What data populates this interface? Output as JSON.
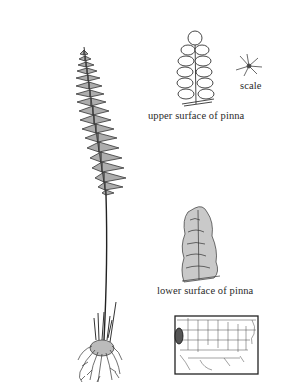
{
  "figure": {
    "labels": {
      "upper_pinna": "upper surface of pinna",
      "scale": "scale",
      "lower_pinna": "lower surface of pinna"
    },
    "map": {
      "region": "United States",
      "highlight": "northern California range"
    }
  },
  "colors": {
    "ink": "#2a2a2a",
    "background": "#ffffff",
    "map_highlight": "#555555"
  }
}
